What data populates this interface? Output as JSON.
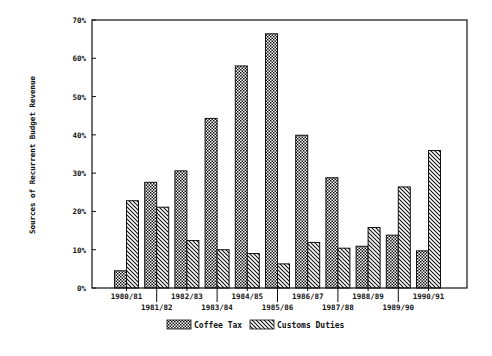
{
  "chart_data": {
    "type": "bar",
    "title": "",
    "xlabel": "",
    "ylabel": "Sources of Recurrent Budget Revenue",
    "ylim": [
      0,
      70
    ],
    "yticks": [
      "0%",
      "10%",
      "20%",
      "30%",
      "40%",
      "50%",
      "60%",
      "70%"
    ],
    "grid": false,
    "legend_position": "bottom",
    "categories": [
      "1980/81",
      "1981/82",
      "1982/83",
      "1983/84",
      "1984/85",
      "1985/86",
      "1986/87",
      "1987/88",
      "1988/89",
      "1989/90",
      "1990/91"
    ],
    "series": [
      {
        "name": "Coffee Tax",
        "pattern": "crosshatch",
        "values": [
          4.5,
          27.6,
          30.6,
          44.3,
          58.0,
          66.4,
          39.9,
          28.8,
          10.9,
          13.8,
          9.7
        ]
      },
      {
        "name": "Customs Duties",
        "pattern": "diagonal",
        "values": [
          22.8,
          21.1,
          12.4,
          10.0,
          9.0,
          6.3,
          11.9,
          10.4,
          15.8,
          26.4,
          35.9
        ]
      }
    ]
  },
  "colors": {
    "ink": "#111111",
    "background": "#ffffff"
  }
}
